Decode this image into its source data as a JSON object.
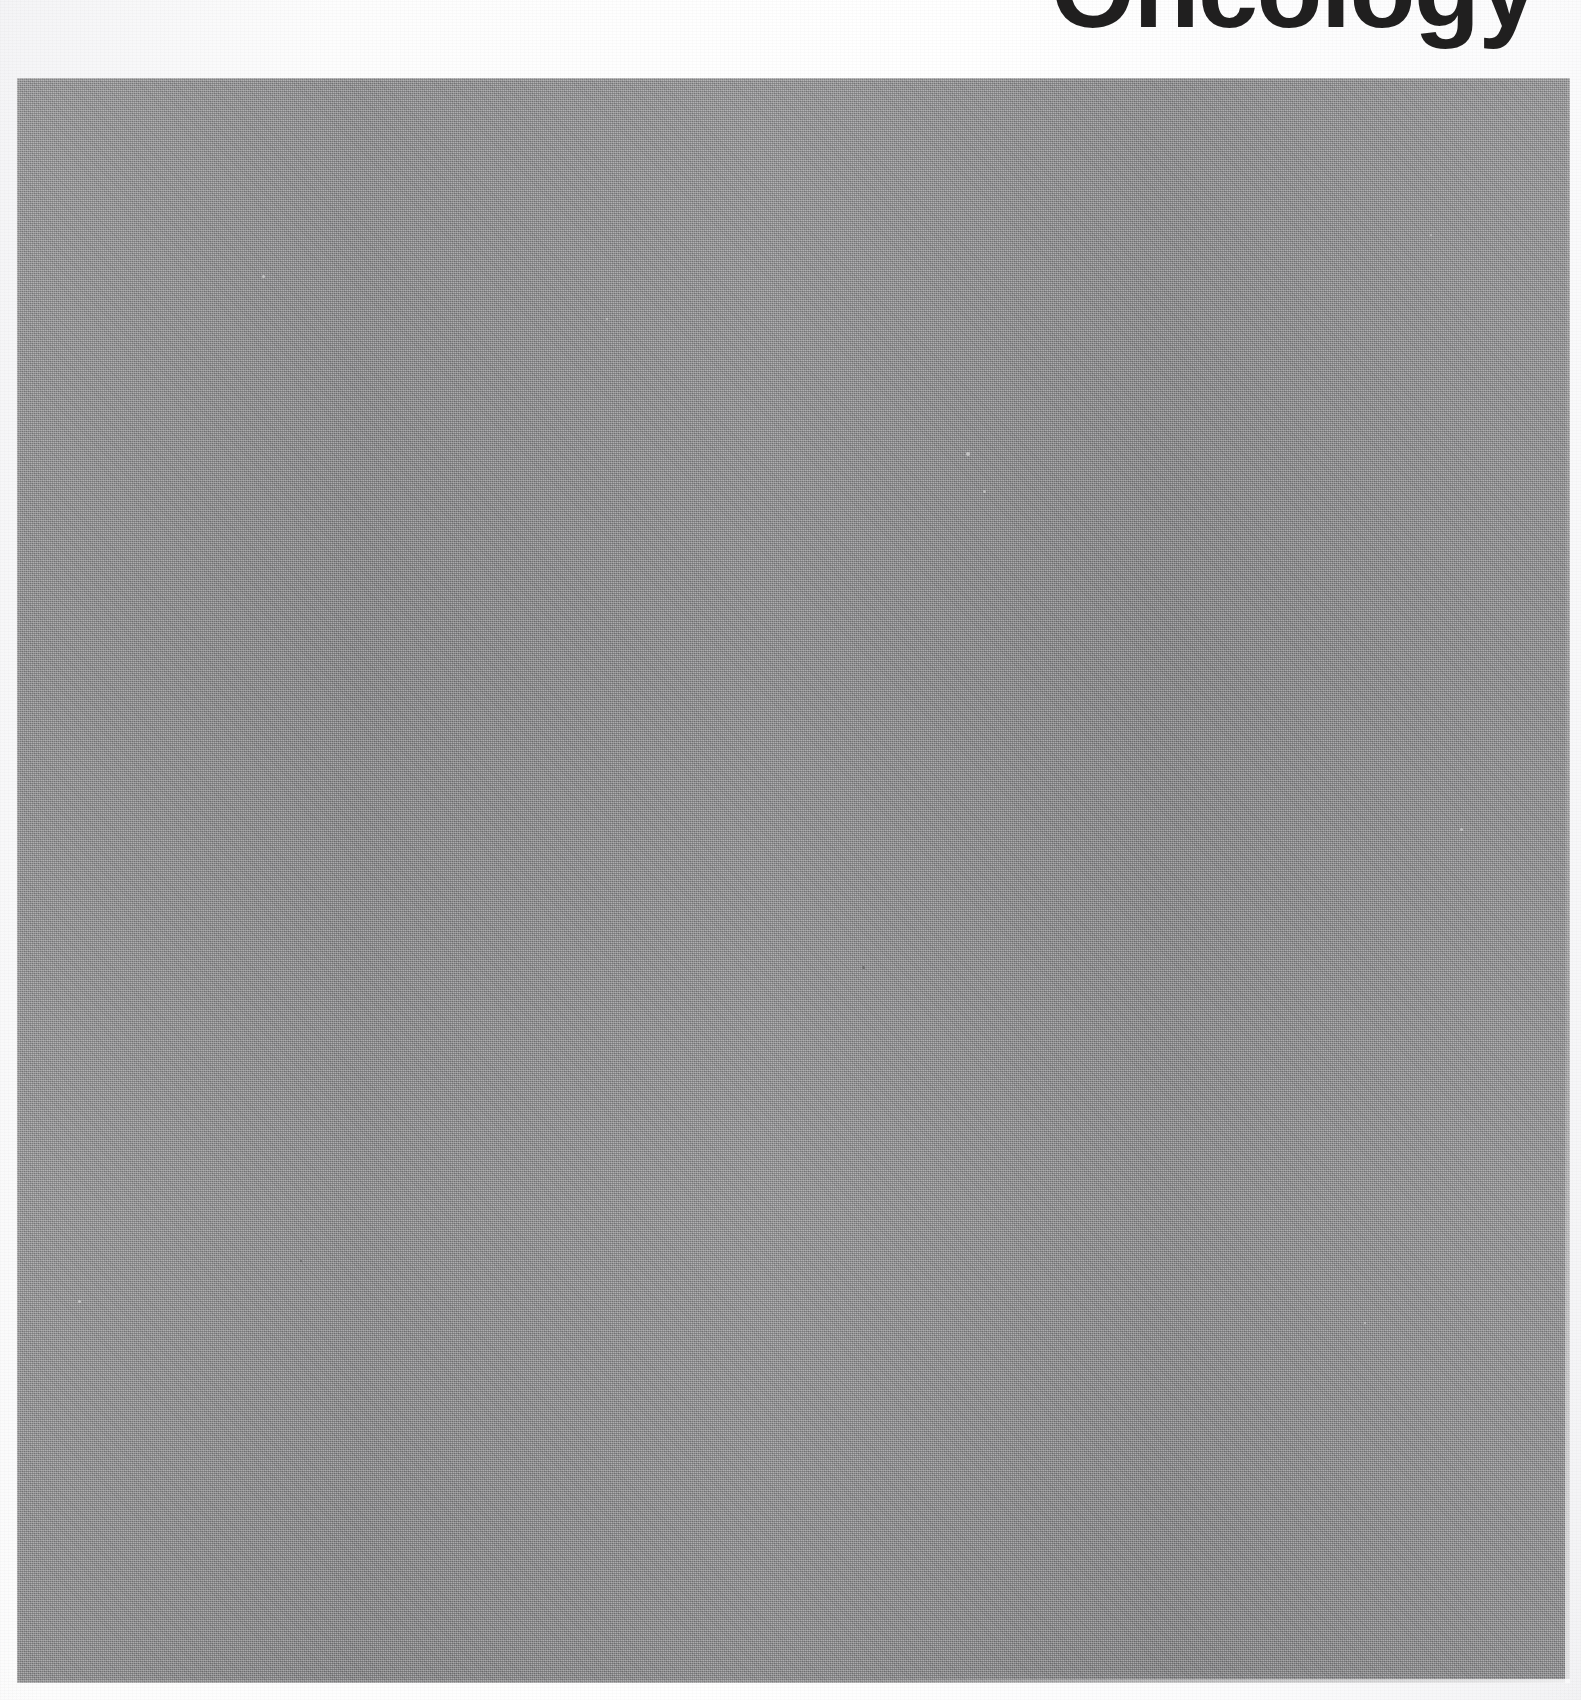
{
  "page": {
    "width_px": 1581,
    "height_px": 1700,
    "background_color": "#fbfbfb",
    "medium": "scanned printed page"
  },
  "heading": {
    "text": "Oncology",
    "color": "#201f1f",
    "alignment": "right",
    "note": "cropped at top edge of page"
  },
  "plate": {
    "label": "",
    "fill_color": "#8e8e90",
    "texture": "halftone-screen",
    "left_px": 17,
    "top_px": 78,
    "width_px": 1553,
    "height_px": 1605
  },
  "specks": [
    {
      "x": 262,
      "y": 275,
      "size": 3,
      "color": "#d8d8d8"
    },
    {
      "x": 606,
      "y": 318,
      "size": 2,
      "color": "#d2d2d2"
    },
    {
      "x": 966,
      "y": 452,
      "size": 4,
      "color": "#dcdcdc"
    },
    {
      "x": 983,
      "y": 490,
      "size": 3,
      "color": "#d0d0d0"
    },
    {
      "x": 1430,
      "y": 234,
      "size": 2,
      "color": "#cfcfcf"
    },
    {
      "x": 1460,
      "y": 828,
      "size": 3,
      "color": "#d4d4d4"
    },
    {
      "x": 862,
      "y": 966,
      "size": 3,
      "color": "#5e5e5e"
    },
    {
      "x": 300,
      "y": 1260,
      "size": 2,
      "color": "#5a5a5a"
    },
    {
      "x": 1364,
      "y": 1322,
      "size": 2,
      "color": "#d6d6d6"
    },
    {
      "x": 78,
      "y": 1300,
      "size": 3,
      "color": "#dadada"
    }
  ]
}
